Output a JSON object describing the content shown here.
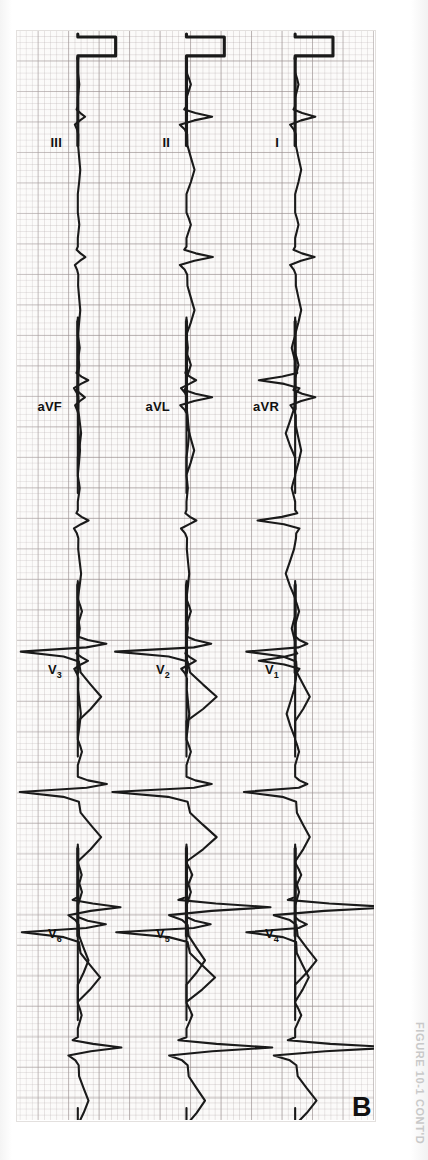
{
  "figure": {
    "panel_letter": "B",
    "caption_running_head": "FIGURE 10-1 CONT'D",
    "kind": "12-lead electrocardiogram",
    "paper": {
      "background_hex": "#fbfaf9",
      "fine_grid_hex": "#aaa0a0",
      "bold_grid_hex": "#968c8c",
      "trace_hex": "#1a1a1a",
      "small_box_px": 6.1,
      "large_box_px": 30.5,
      "speed": "25 mm/s",
      "gain": "10 mm/mV"
    }
  },
  "rows": [
    {
      "row_index": 0,
      "leads": [
        {
          "name": "I",
          "label": "I",
          "label_html": "I"
        },
        {
          "name": "aVR",
          "label": "aVR",
          "label_html": "aVR"
        },
        {
          "name": "V1",
          "label": "V1",
          "label_html": "V<sub>1</sub>"
        },
        {
          "name": "V4",
          "label": "V4",
          "label_html": "V<sub>4</sub>"
        }
      ]
    },
    {
      "row_index": 1,
      "leads": [
        {
          "name": "II",
          "label": "II",
          "label_html": "II"
        },
        {
          "name": "aVL",
          "label": "aVL",
          "label_html": "aVL"
        },
        {
          "name": "V2",
          "label": "V2",
          "label_html": "V<sub>2</sub>"
        },
        {
          "name": "V5",
          "label": "V5",
          "label_html": "V<sub>5</sub>"
        }
      ]
    },
    {
      "row_index": 2,
      "leads": [
        {
          "name": "III",
          "label": "III",
          "label_html": "III"
        },
        {
          "name": "aVF",
          "label": "aVF",
          "label_html": "aVF"
        },
        {
          "name": "V3",
          "label": "V3",
          "label_html": "V<sub>3</sub>"
        },
        {
          "name": "V6",
          "label": "V6",
          "label_html": "V<sub>6</sub>"
        }
      ]
    }
  ],
  "calibration": {
    "present": true,
    "position": "start-of-each-row",
    "shape": "rectangular 1 mV step",
    "amplitude_mv": 1,
    "width_mm": 5
  },
  "chart_data": {
    "type": "line",
    "xlabel": "time",
    "ylabel": "amplitude (mV)",
    "grid": true,
    "legend": "none",
    "layout": "3 rows x 4 columns (I/aVR/V1/V4, II/aVL/V2/V5, III/aVF/V3/V6)",
    "x_units": "seconds (25 mm/s)",
    "y_units": "millivolts (10 mm/mV)",
    "ylim": [
      -1.5,
      2.0
    ],
    "beats_per_column": 3,
    "series": [
      {
        "name": "I",
        "row": 0,
        "col": 0,
        "amp_scale": 0.55,
        "beats": [
          {
            "p": 0.1,
            "q": -0.05,
            "r": 0.6,
            "s": -0.15,
            "t": 0.18
          },
          {
            "p": 0.1,
            "q": -0.05,
            "r": 0.58,
            "s": -0.15,
            "t": 0.18
          },
          {
            "p": 0.1,
            "q": -0.05,
            "r": 0.6,
            "s": -0.14,
            "t": 0.18
          }
        ]
      },
      {
        "name": "aVR",
        "row": 0,
        "col": 1,
        "amp_scale": 0.7,
        "beats": [
          {
            "p": -0.08,
            "q": 0.05,
            "r": -0.85,
            "s": 0.1,
            "t": -0.22
          },
          {
            "p": -0.08,
            "q": 0.05,
            "r": -0.88,
            "s": 0.1,
            "t": -0.22
          },
          {
            "p": -0.08,
            "q": 0.05,
            "r": -0.85,
            "s": 0.1,
            "t": -0.2
          }
        ]
      },
      {
        "name": "V1",
        "row": 0,
        "col": 2,
        "amp_scale": 0.8,
        "beats": [
          {
            "p": 0.08,
            "q": 0.0,
            "r": 0.25,
            "s": -1.0,
            "t": 0.3
          },
          {
            "p": 0.08,
            "q": 0.0,
            "r": 0.25,
            "s": -1.05,
            "t": 0.3
          },
          {
            "p": 0.08,
            "q": 0.0,
            "r": 0.24,
            "s": -1.0,
            "t": 0.28
          }
        ]
      },
      {
        "name": "V4",
        "row": 0,
        "col": 3,
        "amp_scale": 1.0,
        "beats": [
          {
            "p": 0.1,
            "q": -0.12,
            "r": 1.6,
            "s": -0.35,
            "t": 0.35
          },
          {
            "p": 0.1,
            "q": -0.12,
            "r": 1.65,
            "s": -0.35,
            "t": 0.35
          },
          {
            "p": 0.1,
            "q": -0.1,
            "r": 1.55,
            "s": -0.32,
            "t": 0.33
          }
        ]
      },
      {
        "name": "II",
        "row": 1,
        "col": 0,
        "amp_scale": 0.6,
        "beats": [
          {
            "p": 0.12,
            "q": -0.06,
            "r": 0.7,
            "s": -0.18,
            "t": 0.22
          },
          {
            "p": 0.12,
            "q": -0.06,
            "r": 0.72,
            "s": -0.18,
            "t": 0.22
          },
          {
            "p": 0.12,
            "q": -0.06,
            "r": 0.7,
            "s": -0.17,
            "t": 0.21
          }
        ]
      },
      {
        "name": "aVL",
        "row": 1,
        "col": 1,
        "amp_scale": 0.45,
        "beats": [
          {
            "p": 0.05,
            "q": -0.04,
            "r": 0.35,
            "s": -0.2,
            "t": 0.1
          },
          {
            "p": 0.05,
            "q": -0.04,
            "r": 0.36,
            "s": -0.2,
            "t": 0.1
          },
          {
            "p": 0.05,
            "q": -0.04,
            "r": 0.34,
            "s": -0.19,
            "t": 0.1
          }
        ]
      },
      {
        "name": "V2",
        "row": 1,
        "col": 2,
        "amp_scale": 0.9,
        "beats": [
          {
            "p": 0.08,
            "q": 0.0,
            "r": 0.45,
            "s": -1.3,
            "t": 0.55
          },
          {
            "p": 0.08,
            "q": 0.0,
            "r": 0.46,
            "s": -1.35,
            "t": 0.55
          },
          {
            "p": 0.08,
            "q": 0.0,
            "r": 0.44,
            "s": -1.28,
            "t": 0.52
          }
        ]
      },
      {
        "name": "V5",
        "row": 1,
        "col": 3,
        "amp_scale": 0.95,
        "beats": [
          {
            "p": 0.1,
            "q": -0.14,
            "r": 1.45,
            "s": -0.3,
            "t": 0.32
          },
          {
            "p": 0.1,
            "q": -0.14,
            "r": 1.48,
            "s": -0.3,
            "t": 0.32
          },
          {
            "p": 0.1,
            "q": -0.12,
            "r": 1.4,
            "s": -0.28,
            "t": 0.3
          }
        ]
      },
      {
        "name": "III",
        "row": 2,
        "col": 0,
        "amp_scale": 0.4,
        "beats": [
          {
            "p": 0.06,
            "q": -0.05,
            "r": 0.3,
            "s": -0.12,
            "t": 0.1
          },
          {
            "p": 0.06,
            "q": -0.05,
            "r": 0.31,
            "s": -0.12,
            "t": 0.1
          },
          {
            "p": 0.06,
            "q": -0.05,
            "r": 0.29,
            "s": -0.11,
            "t": 0.09
          }
        ]
      },
      {
        "name": "aVF",
        "row": 2,
        "col": 1,
        "amp_scale": 0.45,
        "beats": [
          {
            "p": 0.07,
            "q": -0.05,
            "r": 0.38,
            "s": -0.14,
            "t": 0.12
          },
          {
            "p": 0.07,
            "q": -0.05,
            "r": 0.39,
            "s": -0.14,
            "t": 0.12
          },
          {
            "p": 0.07,
            "q": -0.05,
            "r": 0.37,
            "s": -0.13,
            "t": 0.11
          }
        ]
      },
      {
        "name": "V3",
        "row": 2,
        "col": 2,
        "amp_scale": 0.85,
        "beats": [
          {
            "p": 0.08,
            "q": 0.0,
            "r": 0.55,
            "s": -1.1,
            "t": 0.45
          },
          {
            "p": 0.08,
            "q": 0.0,
            "r": 0.56,
            "s": -1.12,
            "t": 0.45
          },
          {
            "p": 0.08,
            "q": 0.0,
            "r": 0.54,
            "s": -1.08,
            "t": 0.43
          }
        ]
      },
      {
        "name": "V6",
        "row": 2,
        "col": 3,
        "amp_scale": 0.7,
        "beats": [
          {
            "p": 0.09,
            "q": -0.12,
            "r": 1.0,
            "s": -0.22,
            "t": 0.25
          },
          {
            "p": 0.09,
            "q": -0.12,
            "r": 1.02,
            "s": -0.22,
            "t": 0.25
          },
          {
            "p": 0.09,
            "q": -0.1,
            "r": 0.98,
            "s": -0.2,
            "t": 0.24
          }
        ]
      }
    ]
  }
}
